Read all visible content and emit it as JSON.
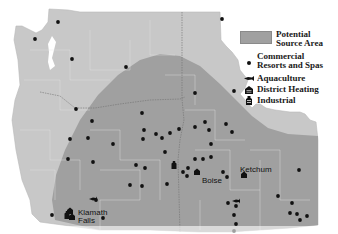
{
  "legend": {
    "source_area": "Potential Source Area",
    "source_area_line1": "Potential",
    "source_area_line2": "Source Area",
    "resorts_line1": "Commercial",
    "resorts_line2": "Resorts and Spas",
    "aquaculture": "Aquaculture",
    "district_heating": "District Heating",
    "industrial": "Industrial"
  },
  "colors": {
    "land": "#c8c8c8",
    "source_area": "#a0a0a0",
    "boundary": "#e2e2e2",
    "state_line": "#6e6e6e",
    "dot": "#111111"
  },
  "cities": {
    "klamath_falls_line1": "Klamath",
    "klamath_falls_line2": "Falls",
    "boise": "Boise",
    "ketchum": "Ketchum"
  },
  "sites": {
    "resorts": [
      [
        58,
        22
      ],
      [
        35,
        39
      ],
      [
        72,
        59
      ],
      [
        126,
        67
      ],
      [
        76,
        109
      ],
      [
        142,
        113
      ],
      [
        92,
        121
      ],
      [
        70,
        139
      ],
      [
        68,
        159
      ],
      [
        88,
        138
      ],
      [
        143,
        139
      ],
      [
        162,
        138
      ],
      [
        156,
        134
      ],
      [
        144,
        130
      ],
      [
        145,
        168
      ],
      [
        165,
        152
      ],
      [
        113,
        144
      ],
      [
        93,
        162
      ],
      [
        136,
        165
      ],
      [
        142,
        186
      ],
      [
        222,
        19
      ],
      [
        234,
        91
      ],
      [
        195,
        93
      ],
      [
        179,
        129
      ],
      [
        195,
        127
      ],
      [
        209,
        130
      ],
      [
        195,
        159
      ],
      [
        203,
        159
      ],
      [
        183,
        172
      ],
      [
        188,
        168
      ],
      [
        187,
        176
      ],
      [
        167,
        184
      ],
      [
        232,
        132
      ],
      [
        227,
        177
      ],
      [
        223,
        172
      ],
      [
        170,
        133
      ],
      [
        205,
        122
      ],
      [
        226,
        124
      ],
      [
        211,
        144
      ],
      [
        211,
        157
      ],
      [
        299,
        170
      ],
      [
        278,
        196
      ],
      [
        292,
        203
      ],
      [
        290,
        213
      ],
      [
        300,
        220
      ],
      [
        297,
        214
      ],
      [
        307,
        216
      ],
      [
        228,
        203
      ],
      [
        236,
        206
      ],
      [
        234,
        215
      ],
      [
        236,
        224
      ],
      [
        234,
        231
      ],
      [
        52,
        215
      ],
      [
        103,
        218
      ],
      [
        96,
        200
      ],
      [
        130,
        185
      ]
    ],
    "district_heating": [
      [
        197,
        172
      ],
      [
        244,
        175
      ],
      [
        70,
        211
      ],
      [
        72,
        217
      ]
    ],
    "aquaculture": [
      [
        93,
        199
      ],
      [
        236,
        201
      ]
    ],
    "industrial": [
      [
        174,
        165
      ],
      [
        67,
        215
      ]
    ]
  }
}
